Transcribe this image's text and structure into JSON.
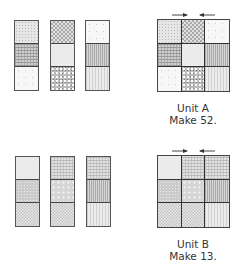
{
  "units": [
    {
      "name": "Unit A",
      "label": "Unit A",
      "instruction": "Make 52.",
      "strips": [
        [
          "dots",
          "weave",
          "white"
        ],
        [
          "check",
          "light",
          "speckle"
        ],
        [
          "white",
          "vstripe",
          "lightstripe"
        ]
      ],
      "pressing_arrows": [
        "right",
        "left"
      ]
    },
    {
      "name": "Unit B",
      "label": "Unit B",
      "instruction": "Make 13.",
      "strips": [
        [
          "light",
          "grain",
          "finecheck"
        ],
        [
          "fineweave",
          "flower",
          "finecheck"
        ],
        [
          "fineweave",
          "vstripe",
          "lightstripe"
        ]
      ],
      "pressing_arrows": [
        "right",
        "left"
      ]
    }
  ],
  "colors": {
    "outline": "#444444",
    "text": "#333333",
    "background": "#ffffff"
  }
}
